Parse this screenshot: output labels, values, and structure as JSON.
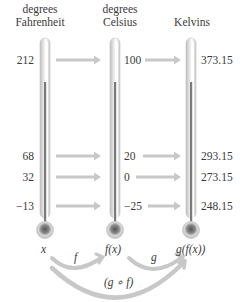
{
  "headers": [
    {
      "line1": "degrees",
      "line2": "Fahrenheit"
    },
    {
      "line1": "degrees",
      "line2": "Celsius"
    },
    {
      "line1": "",
      "line2": "Kelvins"
    }
  ],
  "scales": {
    "fahrenheit": [
      "212",
      "68",
      "32",
      "−13"
    ],
    "celsius": [
      "100",
      "20",
      "0",
      "−25"
    ],
    "kelvin": [
      "373.15",
      "293.15",
      "273.15",
      "248.15"
    ]
  },
  "bottom_labels": {
    "x": "x",
    "fx": "f(x)",
    "gfx": "g(f(x))"
  },
  "arrow_labels": {
    "f": "f",
    "g": "g",
    "composite": "(g ∘ f)"
  },
  "colors": {
    "arrow": "#c8c8c8",
    "thermometer_glass": "#d4d4d4",
    "mercury": "#7a7a7a",
    "text": "#3a3a3a"
  }
}
